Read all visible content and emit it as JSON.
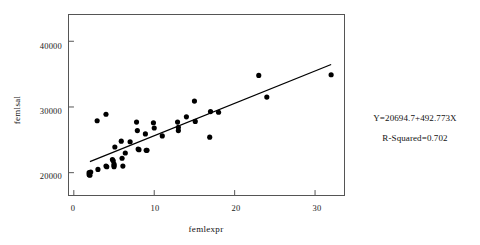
{
  "chart_data": {
    "type": "scatter",
    "title": "",
    "xlabel": "femlexpr",
    "ylabel": "femlsal",
    "xlim": [
      -0.6,
      33.6
    ],
    "ylim": [
      16600,
      44000
    ],
    "xticks": [
      0,
      10,
      20,
      30
    ],
    "xtick_labels": [
      "0",
      "10",
      "20",
      "30"
    ],
    "yticks": [
      20000,
      30000,
      40000
    ],
    "ytick_labels": [
      "20000",
      "30000",
      "40000"
    ],
    "grid": false,
    "legend": null,
    "marker": "filled-circle",
    "marker_color": "#000000",
    "points": [
      {
        "x": 1.9,
        "y": 19700
      },
      {
        "x": 1.9,
        "y": 20000
      },
      {
        "x": 2.0,
        "y": 19600
      },
      {
        "x": 2.1,
        "y": 20100
      },
      {
        "x": 2.9,
        "y": 27900
      },
      {
        "x": 3.0,
        "y": 20500
      },
      {
        "x": 4.0,
        "y": 28900
      },
      {
        "x": 4.0,
        "y": 21000
      },
      {
        "x": 4.1,
        "y": 20900
      },
      {
        "x": 4.8,
        "y": 22000
      },
      {
        "x": 4.9,
        "y": 21800
      },
      {
        "x": 5.0,
        "y": 21300
      },
      {
        "x": 5.0,
        "y": 21100
      },
      {
        "x": 5.0,
        "y": 20900
      },
      {
        "x": 5.1,
        "y": 23900
      },
      {
        "x": 5.9,
        "y": 24800
      },
      {
        "x": 6.0,
        "y": 22200
      },
      {
        "x": 6.1,
        "y": 21000
      },
      {
        "x": 6.4,
        "y": 23000
      },
      {
        "x": 7.0,
        "y": 24700
      },
      {
        "x": 7.8,
        "y": 27700
      },
      {
        "x": 7.9,
        "y": 26400
      },
      {
        "x": 8.0,
        "y": 23600
      },
      {
        "x": 8.1,
        "y": 23500
      },
      {
        "x": 8.9,
        "y": 25900
      },
      {
        "x": 9.0,
        "y": 23400
      },
      {
        "x": 9.1,
        "y": 23400
      },
      {
        "x": 9.9,
        "y": 27600
      },
      {
        "x": 10.0,
        "y": 26800
      },
      {
        "x": 11.0,
        "y": 25600
      },
      {
        "x": 12.9,
        "y": 27700
      },
      {
        "x": 13.0,
        "y": 26900
      },
      {
        "x": 13.0,
        "y": 26400
      },
      {
        "x": 14.0,
        "y": 28500
      },
      {
        "x": 15.0,
        "y": 30900
      },
      {
        "x": 15.1,
        "y": 27800
      },
      {
        "x": 16.9,
        "y": 25400
      },
      {
        "x": 17.0,
        "y": 29300
      },
      {
        "x": 18.0,
        "y": 29200
      },
      {
        "x": 23.0,
        "y": 34800
      },
      {
        "x": 24.0,
        "y": 31500
      },
      {
        "x": 32.0,
        "y": 34900
      }
    ],
    "regression_line": {
      "intercept": 20694.7,
      "slope": 492.773,
      "x_start": 2.0,
      "x_end": 32.0,
      "y_start": 21680,
      "y_end": 36463,
      "color": "#000000"
    },
    "r_squared": 0.702,
    "annotations": [
      "Y=20694.7+492.773X",
      "R-Squared=0.702"
    ]
  },
  "annotation": {
    "equation": "Y=20694.7+492.773X",
    "r_squared": "R-Squared=0.702"
  },
  "axes": {
    "x_title": "femlexpr",
    "y_title": "femlsal"
  }
}
